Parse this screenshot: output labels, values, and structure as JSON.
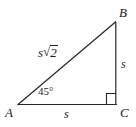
{
  "figure": {
    "type": "right-triangle-diagram",
    "background_color": "#ffffff",
    "stroke_color": "#262626"
  },
  "vertices": {
    "A": {
      "label": "A",
      "x": 18,
      "y": 105
    },
    "B": {
      "label": "B",
      "x": 116,
      "y": 22
    },
    "C": {
      "label": "C",
      "x": 116,
      "y": 105
    }
  },
  "sides": {
    "bottom": {
      "label": "s",
      "from": "A",
      "to": "C"
    },
    "right": {
      "label": "s",
      "from": "B",
      "to": "C"
    },
    "hypotenuse": {
      "base": "s",
      "radical_sign": "√",
      "radicand": "2",
      "label": "s√2",
      "from": "A",
      "to": "B"
    }
  },
  "angles": {
    "at_A": {
      "label": "45°",
      "value": 45,
      "unit": "degrees"
    },
    "at_C": {
      "label": "",
      "value": 90,
      "unit": "degrees",
      "marker": "right-angle-square"
    }
  }
}
